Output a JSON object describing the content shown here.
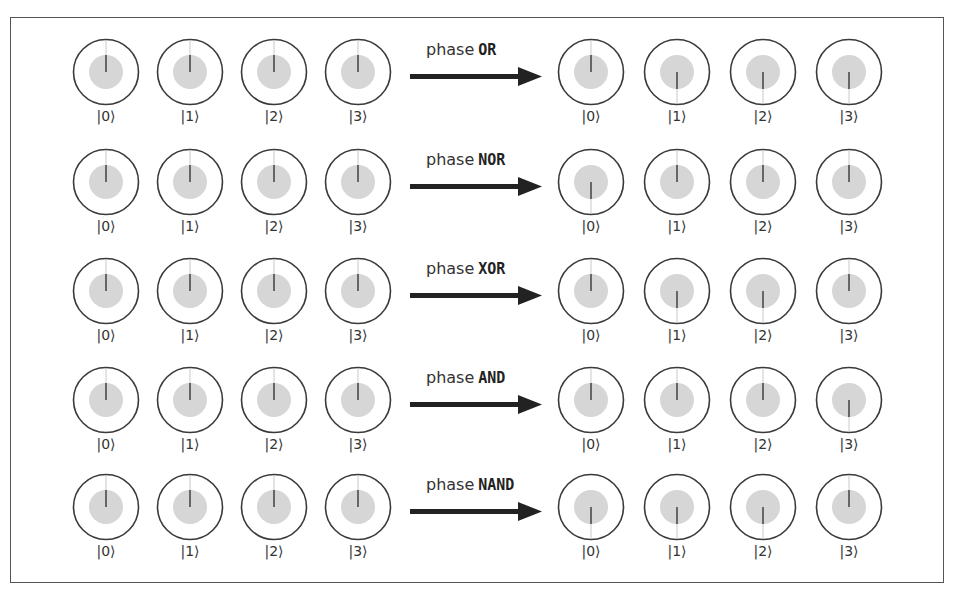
{
  "diagram": {
    "type": "quantum phase logic",
    "colors": {
      "circle_stroke": "#3a3a3a",
      "magnitude_fill": "#d6d6d6",
      "needle": "#666666",
      "arrow": "#222222",
      "frame": "#555555"
    },
    "rows": [
      {
        "operation_prefix": "phase",
        "operation": "OR",
        "input": [
          {
            "ket": "|0⟩",
            "phase": 0
          },
          {
            "ket": "|1⟩",
            "phase": 0
          },
          {
            "ket": "|2⟩",
            "phase": 0
          },
          {
            "ket": "|3⟩",
            "phase": 0
          }
        ],
        "output": [
          {
            "ket": "|0⟩",
            "phase": 0
          },
          {
            "ket": "|1⟩",
            "phase": 180
          },
          {
            "ket": "|2⟩",
            "phase": 180
          },
          {
            "ket": "|3⟩",
            "phase": 180
          }
        ]
      },
      {
        "operation_prefix": "phase",
        "operation": "NOR",
        "input": [
          {
            "ket": "|0⟩",
            "phase": 0
          },
          {
            "ket": "|1⟩",
            "phase": 0
          },
          {
            "ket": "|2⟩",
            "phase": 0
          },
          {
            "ket": "|3⟩",
            "phase": 0
          }
        ],
        "output": [
          {
            "ket": "|0⟩",
            "phase": 180
          },
          {
            "ket": "|1⟩",
            "phase": 0
          },
          {
            "ket": "|2⟩",
            "phase": 0
          },
          {
            "ket": "|3⟩",
            "phase": 0
          }
        ]
      },
      {
        "operation_prefix": "phase",
        "operation": "XOR",
        "input": [
          {
            "ket": "|0⟩",
            "phase": 0
          },
          {
            "ket": "|1⟩",
            "phase": 0
          },
          {
            "ket": "|2⟩",
            "phase": 0
          },
          {
            "ket": "|3⟩",
            "phase": 0
          }
        ],
        "output": [
          {
            "ket": "|0⟩",
            "phase": 0
          },
          {
            "ket": "|1⟩",
            "phase": 180
          },
          {
            "ket": "|2⟩",
            "phase": 180
          },
          {
            "ket": "|3⟩",
            "phase": 0
          }
        ]
      },
      {
        "operation_prefix": "phase",
        "operation": "AND",
        "input": [
          {
            "ket": "|0⟩",
            "phase": 0
          },
          {
            "ket": "|1⟩",
            "phase": 0
          },
          {
            "ket": "|2⟩",
            "phase": 0
          },
          {
            "ket": "|3⟩",
            "phase": 0
          }
        ],
        "output": [
          {
            "ket": "|0⟩",
            "phase": 0
          },
          {
            "ket": "|1⟩",
            "phase": 0
          },
          {
            "ket": "|2⟩",
            "phase": 0
          },
          {
            "ket": "|3⟩",
            "phase": 180
          }
        ]
      },
      {
        "operation_prefix": "phase",
        "operation": "NAND",
        "input": [
          {
            "ket": "|0⟩",
            "phase": 0
          },
          {
            "ket": "|1⟩",
            "phase": 0
          },
          {
            "ket": "|2⟩",
            "phase": 0
          },
          {
            "ket": "|3⟩",
            "phase": 0
          }
        ],
        "output": [
          {
            "ket": "|0⟩",
            "phase": 180
          },
          {
            "ket": "|1⟩",
            "phase": 180
          },
          {
            "ket": "|2⟩",
            "phase": 180
          },
          {
            "ket": "|3⟩",
            "phase": 0
          }
        ]
      }
    ]
  }
}
